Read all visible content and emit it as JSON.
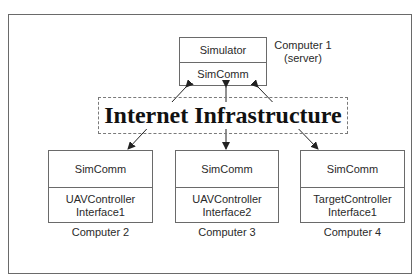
{
  "diagram": {
    "server": {
      "top_label": "Simulator",
      "bottom_label": "SimComm",
      "caption_line1": "Computer 1",
      "caption_line2": "(server)"
    },
    "network": {
      "label": "Internet Infrastructure"
    },
    "clients": [
      {
        "top_label": "SimComm",
        "bottom_line1": "UAVController",
        "bottom_line2": "Interface1",
        "caption": "Computer 2"
      },
      {
        "top_label": "SimComm",
        "bottom_line1": "UAVController",
        "bottom_line2": "Interface2",
        "caption": "Computer 3"
      },
      {
        "top_label": "SimComm",
        "bottom_line1": "TargetController",
        "bottom_line2": "Interface1",
        "caption": "Computer 4"
      }
    ],
    "connections": [
      {
        "from": "Computer 1",
        "to": "Computer 2",
        "style": "bidirectional-arrow"
      },
      {
        "from": "Computer 1",
        "to": "Computer 3",
        "style": "bidirectional-arrow"
      },
      {
        "from": "Computer 1",
        "to": "Computer 4",
        "style": "bidirectional-arrow"
      }
    ],
    "colors": {
      "line": "#6a6a6a",
      "arrow": "#222222",
      "text": "#2a2a2a"
    }
  }
}
